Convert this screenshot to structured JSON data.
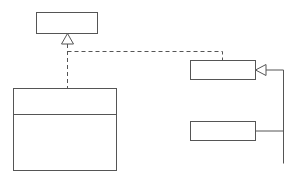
{
  "diagram": {
    "type": "UML class diagram",
    "classes": {
      "timed": {
        "name": "Timed",
        "abstract": true
      },
      "sprite": {
        "name": "Sprite"
      },
      "collision_detector": {
        "name": "CollisionDetector",
        "methods": [
          "addAlien()",
          "removeAlien()",
          "addMissile()",
          "removeMissile()"
        ]
      },
      "missile": {
        "name": "Missile"
      },
      "alien": {
        "name": "Alien"
      },
      "spaceship": {
        "name": "SpaceShip"
      }
    },
    "associations": [
      {
        "from": "CollisionDetector",
        "to": "Missile",
        "mult_from": "1",
        "mult_to": "*",
        "role": "missile"
      },
      {
        "from": "CollisionDetector",
        "to": "Alien",
        "mult_from": "1",
        "mult_to": "*",
        "role": "aliens"
      },
      {
        "from": "CollisionDetector",
        "to": "SpaceShip",
        "mult_from": "1",
        "mult_to": "1",
        "role": "ship"
      }
    ],
    "relationships": [
      {
        "kind": "realization",
        "from": "CollisionDetector",
        "to": "Timed"
      },
      {
        "kind": "realization",
        "from": "Sprite",
        "to": "Timed"
      },
      {
        "kind": "generalization",
        "from": "Missile",
        "to": "Sprite"
      },
      {
        "kind": "generalization",
        "from": "Alien",
        "to": "Sprite"
      },
      {
        "kind": "generalization",
        "from": "SpaceShip",
        "to": "Sprite"
      }
    ],
    "colors": {
      "line": "#555555",
      "text": "#333333",
      "background": "#ffffff"
    }
  }
}
